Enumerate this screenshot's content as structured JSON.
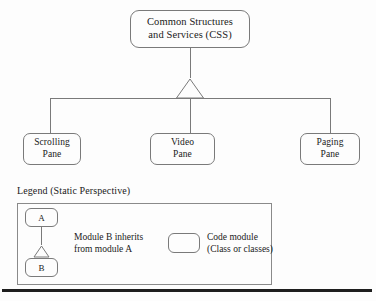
{
  "diagram": {
    "root": {
      "line1": "Common Structures",
      "line2": "and Services (CSS)"
    },
    "children": [
      {
        "line1": "Scrolling",
        "line2": "Pane"
      },
      {
        "line1": "Video",
        "line2": "Pane"
      },
      {
        "line1": "Paging",
        "line2": "Pane"
      }
    ]
  },
  "legend": {
    "title": "Legend (Static Perspective)",
    "node_a": "A",
    "node_b": "B",
    "inherit_line1": "Module B inherits",
    "inherit_line2": "from module A",
    "module_line1": "Code module",
    "module_line2": "(Class or classes)"
  },
  "style": {
    "stroke": "#7a7a7a",
    "text": "#1a1a1a",
    "background": "#fdfdfd",
    "rule": "#1e1e1e"
  }
}
